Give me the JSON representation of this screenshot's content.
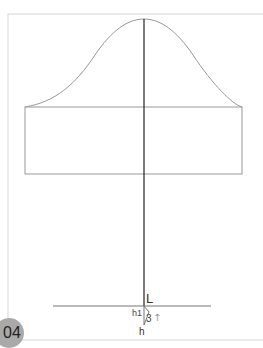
{
  "figure": {
    "badge": "04",
    "labels": {
      "L": "L",
      "h1": "h1",
      "three": "3",
      "h": "h",
      "arrow": "↑"
    },
    "colors": {
      "frame": "#d0d0d0",
      "outline": "#999999",
      "center_line": "#222222",
      "badge_bg": "#a9a9a9"
    }
  }
}
